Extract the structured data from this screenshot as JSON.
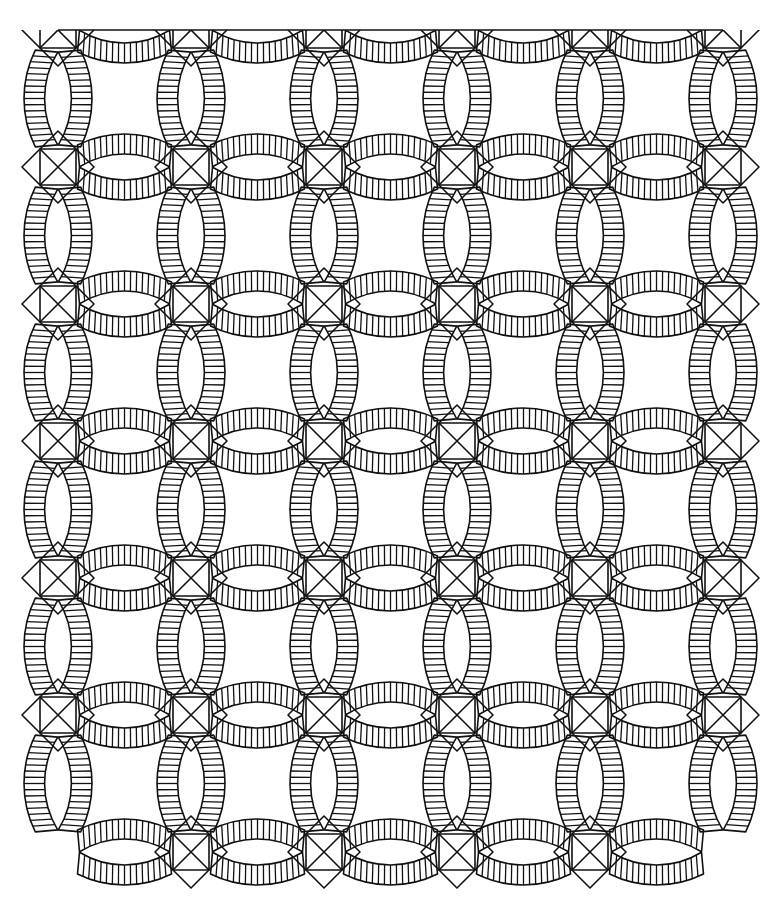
{
  "image": {
    "subject": "Double Wedding Ring quilt pattern line drawing",
    "style": "black line art on white",
    "colors": {
      "line": "#111111",
      "background": "#ffffff"
    }
  },
  "pattern": {
    "grid_columns": 6,
    "grid_rows": 7,
    "ring_columns": 5,
    "ring_rows": 6,
    "ticks_per_band": 16,
    "elements": [
      "melon arcs with radial piecing",
      "diamond corner squares",
      "top border line"
    ]
  }
}
